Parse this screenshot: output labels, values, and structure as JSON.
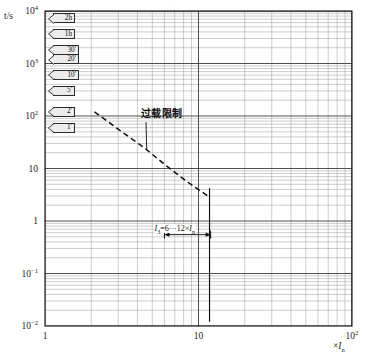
{
  "caption": {
    "text": "图 过载和短路保护配合曲线示意图"
  },
  "chart_data": {
    "type": "line",
    "title": "",
    "xlabel": "×I_n",
    "ylabel": "t/s",
    "axis_scale": "log-log",
    "grid": true,
    "xlim": [
      1,
      100
    ],
    "ylim": [
      0.01,
      10000
    ],
    "x_ticks": [
      "1",
      "10",
      "10²"
    ],
    "x_tick_values": [
      1,
      10,
      100
    ],
    "y_ticks": [
      "10⁴",
      "10³",
      "10²",
      "10",
      "1",
      "10⁻¹",
      "10⁻²"
    ],
    "y_tick_values": [
      10000,
      1000,
      100,
      10,
      1,
      0.1,
      0.01
    ],
    "series": [
      {
        "name": "过载限制",
        "style": "dashed",
        "points": [
          {
            "x": 2.1,
            "y": 120
          },
          {
            "x": 3.0,
            "y": 56
          },
          {
            "x": 4.5,
            "y": 24
          },
          {
            "x": 6.0,
            "y": 12
          },
          {
            "x": 8.5,
            "y": 5.5
          },
          {
            "x": 11.5,
            "y": 3.0
          }
        ]
      }
    ],
    "annotations": [
      {
        "id": "overload-limit",
        "text": "过载限制",
        "leader_to_x": 4.6,
        "leader_to_y": 22
      },
      {
        "id": "i3-range",
        "text": "I₃=6···12×Iₙ",
        "x_from": 6,
        "x_to": 12,
        "y": 0.55
      }
    ],
    "time_flags": [
      {
        "label": "2h",
        "seconds": 7200,
        "y": 7200
      },
      {
        "label": "1h",
        "seconds": 3600,
        "y": 3600
      },
      {
        "label": "30'",
        "seconds": 1800,
        "y": 1800
      },
      {
        "label": "20'",
        "seconds": 1200,
        "y": 1200
      },
      {
        "label": "10'",
        "seconds": 600,
        "y": 600
      },
      {
        "label": "5'",
        "seconds": 300,
        "y": 300
      },
      {
        "label": "2'",
        "seconds": 120,
        "y": 120
      },
      {
        "label": "1'",
        "seconds": 60,
        "y": 60
      }
    ]
  },
  "axes": {
    "y_axis_title": "t/s",
    "x_axis_title_prefix": "×",
    "x_axis_title_symbol": "I",
    "x_axis_title_sub": "n",
    "y_tick_labels": [
      {
        "mantissa": "10",
        "exp": "4"
      },
      {
        "mantissa": "10",
        "exp": "3"
      },
      {
        "mantissa": "10",
        "exp": "2"
      },
      {
        "mantissa": "10",
        "exp": ""
      },
      {
        "mantissa": "1",
        "exp": ""
      },
      {
        "mantissa": "10",
        "exp": "−1"
      },
      {
        "mantissa": "10",
        "exp": "−2"
      }
    ],
    "x_tick_labels": [
      {
        "mantissa": "1",
        "exp": ""
      },
      {
        "mantissa": "10",
        "exp": ""
      },
      {
        "mantissa": "10",
        "exp": "2"
      }
    ]
  },
  "colors": {
    "grid_minor": "#9a9a9a",
    "grid_major": "#3c3c3c",
    "frame": "#111111",
    "curve": "#0d0d0d",
    "flag_fill": "#ececec",
    "text": "#141414"
  }
}
